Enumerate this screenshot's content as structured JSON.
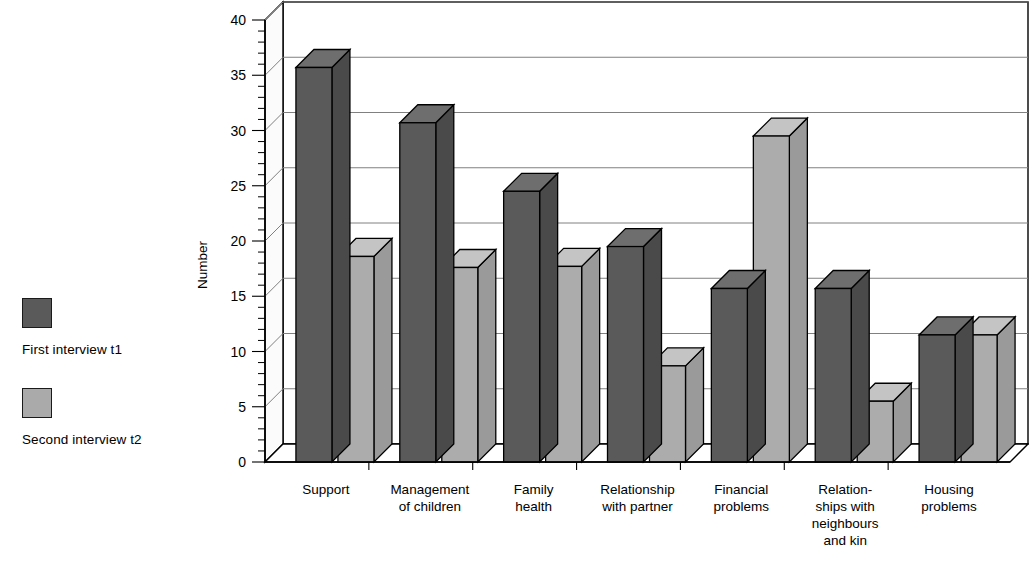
{
  "legend": {
    "items": [
      {
        "label": "First interview t1",
        "color": "#5a5a5a",
        "swatch_name": "legend-swatch-t1"
      },
      {
        "label": "Second interview t2",
        "color": "#aaaaaa",
        "swatch_name": "legend-swatch-t2"
      }
    ]
  },
  "chart_data": {
    "type": "bar",
    "title": "",
    "xlabel": "",
    "ylabel": "Number",
    "ylim": [
      0,
      40
    ],
    "ytick_step": 5,
    "yticks": [
      "0",
      "5",
      "10",
      "15",
      "20",
      "25",
      "30",
      "35",
      "40"
    ],
    "minor_tick_step": 1,
    "grid": true,
    "grid_axis": "y",
    "legend_position": "left",
    "three_d": true,
    "categories": [
      "Support",
      "Management of children",
      "Family health",
      "Relationship with partner",
      "Financial problems",
      "Relationships with neighbours and kin",
      "Housing problems"
    ],
    "category_label_lines": [
      [
        "Support"
      ],
      [
        "Management",
        "of children"
      ],
      [
        "Family",
        "health"
      ],
      [
        "Relationship",
        "with partner"
      ],
      [
        "Financial",
        "problems"
      ],
      [
        "Relation-",
        "ships with",
        "neighbours",
        "and kin"
      ],
      [
        "Housing",
        "problems"
      ]
    ],
    "series": [
      {
        "name": "First interview t1",
        "color": "#5a5a5a",
        "values": [
          35.7,
          30.7,
          24.5,
          19.5,
          15.7,
          15.7,
          11.5
        ]
      },
      {
        "name": "Second interview t2",
        "color": "#aaaaaa",
        "values": [
          18.6,
          17.6,
          17.7,
          8.7,
          29.5,
          5.5,
          11.5
        ]
      }
    ]
  }
}
